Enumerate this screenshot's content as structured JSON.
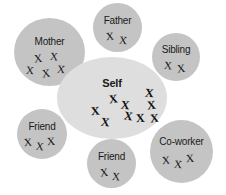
{
  "diagram": {
    "type": "concentric-social-circles",
    "background_color": "#ffffff",
    "center_fill": "#dedede",
    "satellite_fill": "#c4c4c4",
    "mark_glyph": "X",
    "mark_color": "#111111",
    "center": {
      "id": "self",
      "label": "Self",
      "shape": "ellipse",
      "x": 57,
      "y": 57,
      "w": 110,
      "h": 82,
      "label_top": 20,
      "mark_count": 9,
      "marks": [
        {
          "x": 52,
          "y": 36,
          "rot": -8,
          "size": 12
        },
        {
          "x": 64,
          "y": 42,
          "rot": 6,
          "size": 12
        },
        {
          "x": 34,
          "y": 48,
          "rot": -5,
          "size": 12
        },
        {
          "x": 67,
          "y": 53,
          "rot": 9,
          "size": 12
        },
        {
          "x": 79,
          "y": 55,
          "rot": -4,
          "size": 12
        },
        {
          "x": 44,
          "y": 59,
          "rot": 7,
          "size": 12
        },
        {
          "x": 93,
          "y": 55,
          "rot": -6,
          "size": 12
        },
        {
          "x": 88,
          "y": 30,
          "rot": 5,
          "size": 12
        },
        {
          "x": 90,
          "y": 42,
          "rot": -7,
          "size": 12
        }
      ]
    },
    "satellites": [
      {
        "id": "mother",
        "label": "Mother",
        "shape": "circle",
        "x": 14,
        "y": 18,
        "w": 71,
        "h": 68,
        "label_top": 18,
        "mark_count": 5,
        "marks": [
          {
            "x": 20,
            "y": 35,
            "rot": -6,
            "size": 11
          },
          {
            "x": 36,
            "y": 33,
            "rot": 5,
            "size": 11
          },
          {
            "x": 12,
            "y": 47,
            "rot": 4,
            "size": 11
          },
          {
            "x": 28,
            "y": 50,
            "rot": -8,
            "size": 11
          },
          {
            "x": 43,
            "y": 46,
            "rot": 6,
            "size": 11
          }
        ]
      },
      {
        "id": "father",
        "label": "Father",
        "shape": "circle",
        "x": 93,
        "y": 3,
        "w": 49,
        "h": 49,
        "label_top": 12,
        "mark_count": 2,
        "marks": [
          {
            "x": 13,
            "y": 28,
            "rot": -5,
            "size": 11
          },
          {
            "x": 26,
            "y": 32,
            "rot": 6,
            "size": 11
          }
        ]
      },
      {
        "id": "sibling",
        "label": "Sibling",
        "shape": "circle",
        "x": 152,
        "y": 33,
        "w": 48,
        "h": 48,
        "label_top": 11,
        "mark_count": 2,
        "marks": [
          {
            "x": 12,
            "y": 27,
            "rot": 5,
            "size": 11
          },
          {
            "x": 25,
            "y": 30,
            "rot": -6,
            "size": 11
          }
        ]
      },
      {
        "id": "friend-left",
        "label": "Friend",
        "shape": "circle",
        "x": 17,
        "y": 109,
        "w": 50,
        "h": 50,
        "label_top": 12,
        "mark_count": 3,
        "marks": [
          {
            "x": 7,
            "y": 28,
            "rot": -5,
            "size": 11
          },
          {
            "x": 19,
            "y": 32,
            "rot": 7,
            "size": 11
          },
          {
            "x": 30,
            "y": 27,
            "rot": -4,
            "size": 11
          }
        ]
      },
      {
        "id": "friend-bottom",
        "label": "Friend",
        "shape": "circle",
        "x": 87,
        "y": 139,
        "w": 49,
        "h": 49,
        "label_top": 12,
        "mark_count": 2,
        "marks": [
          {
            "x": 13,
            "y": 28,
            "rot": -6,
            "size": 11
          },
          {
            "x": 25,
            "y": 32,
            "rot": 5,
            "size": 11
          }
        ]
      },
      {
        "id": "co-worker",
        "label": "Co-worker",
        "shape": "circle",
        "x": 150,
        "y": 120,
        "w": 63,
        "h": 63,
        "label_top": 16,
        "mark_count": 3,
        "marks": [
          {
            "x": 12,
            "y": 35,
            "rot": -5,
            "size": 11
          },
          {
            "x": 24,
            "y": 39,
            "rot": 6,
            "size": 11
          },
          {
            "x": 36,
            "y": 33,
            "rot": -4,
            "size": 11
          }
        ]
      }
    ]
  }
}
